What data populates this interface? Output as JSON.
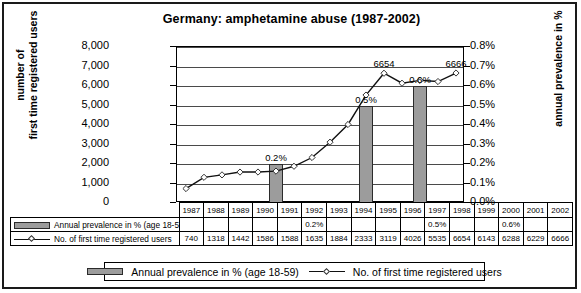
{
  "chart_data": {
    "type": "bar",
    "title": "Germany: amphetamine abuse (1987-2002)",
    "categories": [
      "1987",
      "1988",
      "1989",
      "1990",
      "1991",
      "1992",
      "1993",
      "1994",
      "1995",
      "1996",
      "1997",
      "1998",
      "1999",
      "2000",
      "2001",
      "2002"
    ],
    "series": [
      {
        "name": "Annual prevalence in % (age 18-59)",
        "type": "bar",
        "axis": "right",
        "values": [
          null,
          null,
          null,
          null,
          null,
          0.2,
          null,
          null,
          null,
          null,
          0.5,
          null,
          null,
          0.6,
          null,
          null
        ],
        "labels": [
          "",
          "",
          "",
          "",
          "",
          "0.2%",
          "",
          "",
          "",
          "",
          "0.5%",
          "",
          "",
          "0.6%",
          "",
          ""
        ]
      },
      {
        "name": "No. of first time registered users",
        "type": "line",
        "axis": "left",
        "values": [
          740,
          1318,
          1442,
          1586,
          1588,
          1635,
          1884,
          2333,
          3119,
          4026,
          5535,
          6654,
          6143,
          6288,
          6229,
          6666
        ],
        "point_labels": {
          "1998": "6654",
          "2002": "6666"
        }
      }
    ],
    "xlabel": "",
    "ylabel": "number of first time registered users",
    "y2label": "annual prevalence in %",
    "ylim": [
      0,
      8000
    ],
    "y2lim": [
      0,
      0.8
    ],
    "yticks": [
      "0",
      "1,000",
      "2,000",
      "3,000",
      "4,000",
      "5,000",
      "6,000",
      "7,000",
      "8,000"
    ],
    "y2ticks": [
      "0.0%",
      "0.1%",
      "0.2%",
      "0.3%",
      "0.4%",
      "0.5%",
      "0.6%",
      "0.7%",
      "0.8%"
    ],
    "grid": true,
    "legend_position": "bottom",
    "colors": {
      "bar": "#9c9c9c",
      "bar_border": "#2b2b2b",
      "line": "#111111",
      "marker_fill": "#ffffff"
    }
  },
  "table": {
    "row_labels": [
      "Annual prevalence in % (age 18-59)",
      "No. of first time registered users"
    ],
    "years": [
      "1987",
      "1988",
      "1989",
      "1990",
      "1991",
      "1992",
      "1993",
      "1994",
      "1995",
      "1996",
      "1997",
      "1998",
      "1999",
      "2000",
      "2001",
      "2002"
    ],
    "prevalence": [
      "",
      "",
      "",
      "",
      "",
      "0.2%",
      "",
      "",
      "",
      "",
      "0.5%",
      "",
      "",
      "0.6%",
      "",
      ""
    ],
    "users": [
      "740",
      "1318",
      "1442",
      "1586",
      "1588",
      "1635",
      "1884",
      "2333",
      "3119",
      "4026",
      "5535",
      "6654",
      "6143",
      "6288",
      "6229",
      "6666"
    ]
  },
  "legend": {
    "bar_label": "Annual prevalence in % (age 18-59)",
    "line_label": "No. of first time registered users"
  }
}
